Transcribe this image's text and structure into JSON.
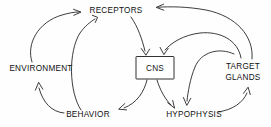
{
  "diagram": {
    "background_color": "#fefefe",
    "stroke_color": "#1a1a1a",
    "text_color": "#111111",
    "nodes": [
      {
        "id": "receptors",
        "label": "RECEPTORS",
        "shape": "text",
        "x": 116,
        "y": 11
      },
      {
        "id": "environment",
        "label": "ENVIRONMENT",
        "shape": "text",
        "x": 41,
        "y": 69
      },
      {
        "id": "cns",
        "label": "CNS",
        "shape": "box",
        "x": 155,
        "y": 68
      },
      {
        "id": "target_glands",
        "label_line1": "TARGET",
        "label_line2": "GLANDS",
        "shape": "text",
        "x": 243,
        "y": 72
      },
      {
        "id": "behavior",
        "label": "BEHAVIOR",
        "shape": "text",
        "x": 88,
        "y": 115
      },
      {
        "id": "hypophysis",
        "label": "HYPOPHYSIS",
        "shape": "text",
        "x": 194,
        "y": 115
      }
    ],
    "edges": [
      {
        "from": "environment",
        "to": "receptors",
        "style": "curved"
      },
      {
        "from": "behavior",
        "to": "receptors",
        "style": "curved"
      },
      {
        "from": "target_glands",
        "to": "receptors",
        "style": "curved"
      },
      {
        "from": "receptors",
        "to": "cns",
        "style": "curved"
      },
      {
        "from": "target_glands",
        "to": "cns",
        "style": "curved"
      },
      {
        "from": "cns",
        "to": "behavior",
        "style": "curved"
      },
      {
        "from": "cns",
        "to": "hypophysis",
        "style": "curved"
      },
      {
        "from": "target_glands",
        "to": "hypophysis",
        "style": "curved"
      },
      {
        "from": "hypophysis",
        "to": "target_glands",
        "style": "curved"
      },
      {
        "from": "behavior",
        "to": "environment",
        "style": "curved"
      }
    ]
  }
}
